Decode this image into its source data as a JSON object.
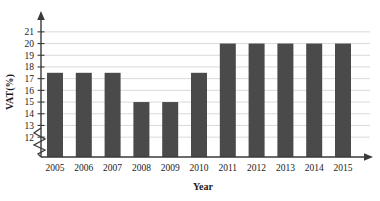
{
  "chart_data": {
    "type": "bar",
    "title": "",
    "xlabel": "Year",
    "ylabel": "VAT(%)",
    "categories": [
      "2005",
      "2006",
      "2007",
      "2008",
      "2009",
      "2010",
      "2011",
      "2012",
      "2013",
      "2014",
      "2015"
    ],
    "values": [
      17.5,
      17.5,
      17.5,
      15.0,
      15.0,
      17.5,
      20.0,
      20.0,
      20.0,
      20.0,
      20.0
    ],
    "ylim": [
      11.5,
      21.5
    ],
    "y_ticks": [
      12,
      13,
      14,
      15,
      16,
      17,
      18,
      19,
      20,
      21
    ],
    "y_tick_labels": [
      "12",
      "13",
      "14",
      "15",
      "16",
      "17",
      "18",
      "19",
      "20",
      "21"
    ],
    "grid": true,
    "grid_axis": "y",
    "legend": "none",
    "axis_break": true,
    "axis_break_note": "zigzag break on y-axis below 12",
    "bar_color": "#4a4a4a",
    "grid_color": "#c9c9c9",
    "axis_color": "#3a3a3a",
    "background_color": "#ffffff",
    "series": [
      {
        "name": "VAT rate",
        "values": [
          17.5,
          17.5,
          17.5,
          15.0,
          15.0,
          17.5,
          20.0,
          20.0,
          20.0,
          20.0,
          20.0
        ]
      }
    ]
  },
  "artifacts": {
    "top_clipped_text": ""
  }
}
